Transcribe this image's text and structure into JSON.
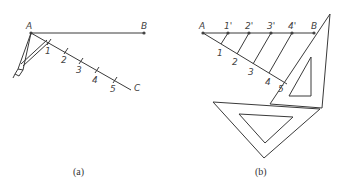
{
  "figure": {
    "panels": [
      {
        "id": "a",
        "caption": "(a)",
        "points": {
          "A": "A",
          "B": "B",
          "C": "C"
        },
        "divisions": [
          "1",
          "2",
          "3",
          "4",
          "5"
        ],
        "tool": "compass"
      },
      {
        "id": "b",
        "caption": "(b)",
        "points": {
          "A": "A",
          "B": "B"
        },
        "divisions": [
          "1",
          "2",
          "3",
          "4",
          "5"
        ],
        "projected_divisions": [
          "1'",
          "2'",
          "3'",
          "4'"
        ],
        "tool": "set squares"
      }
    ]
  },
  "colors": {
    "line": "#3a3a3a",
    "background": "#ffffff"
  }
}
